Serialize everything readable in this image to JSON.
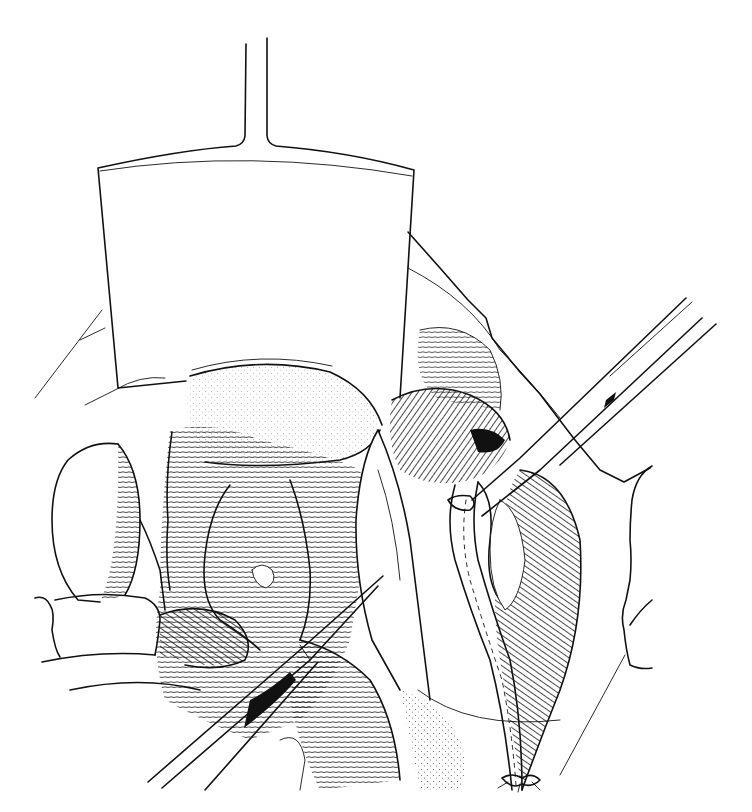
{
  "illustration": {
    "kind": "surgical-line-drawing",
    "style": "black-and-white pen-and-ink with line hatching and stippling",
    "background_color": "#ffffff",
    "ink_color": "#111111",
    "elements": [
      {
        "name": "retractor",
        "description": "Wide flat retractor blade with thin vertical handle, top-left center"
      },
      {
        "name": "forceps-upper-right",
        "description": "Long surgical clamp entering from upper right"
      },
      {
        "name": "forceps-lower-left",
        "description": "Long surgical clamp entering from lower left"
      },
      {
        "name": "small-bowel-loops",
        "description": "Hatched bowel loops occupying the center-left"
      },
      {
        "name": "mesentery-vessel",
        "description": "Vessel/tube running diagonally down to a ligature at bottom center"
      },
      {
        "name": "ligature-knot",
        "description": "Tied suture at lower center"
      },
      {
        "name": "incision-edge",
        "description": "Abdominal wall edges on the right and left"
      }
    ]
  }
}
